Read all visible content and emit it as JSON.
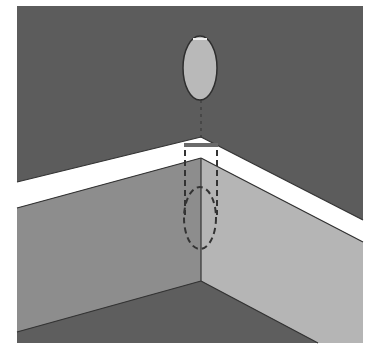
{
  "diagram": {
    "colors": {
      "background": "#ffffff",
      "upper_wall": "#5c5c5c",
      "molding": "#ffffff",
      "left_wall": "#8c8c8c",
      "right_wall": "#b4b4b4",
      "floor": "#5e5e5e",
      "oval_fill": "#b8b8b8",
      "outline": "#333333"
    },
    "elements": [
      {
        "name": "hanging-oval",
        "shape": "ellipse",
        "cx": 200,
        "cy": 68,
        "rx": 17,
        "ry": 32
      },
      {
        "name": "projection-bar",
        "shape": "line",
        "x1": 184,
        "y1": 145,
        "x2": 218,
        "y2": 145
      },
      {
        "name": "projected-dashed-ellipse",
        "shape": "ellipse",
        "cx": 200,
        "cy": 218,
        "rx": 16,
        "ry": 31,
        "style": "dashed"
      }
    ]
  }
}
